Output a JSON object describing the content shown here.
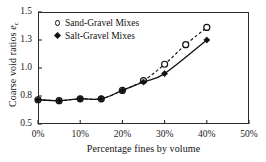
{
  "chart_data": {
    "type": "line",
    "title": "",
    "xlabel": "Percentage fines by volume",
    "ylabel": "Coarse void ratios",
    "ylabel_symbol": "e",
    "ylabel_subscript": "c",
    "x": [
      0,
      5,
      10,
      15,
      20,
      25,
      30,
      35,
      40
    ],
    "xtick_labels": [
      "0%",
      "10%",
      "20%",
      "30%",
      "40%",
      "50%"
    ],
    "xtick_values": [
      0,
      10,
      20,
      30,
      40,
      50
    ],
    "ytick_labels": [
      "0.5",
      "0.8",
      "1.0",
      "1.3",
      "1.5"
    ],
    "ytick_values": [
      0.5,
      0.8,
      1.0,
      1.3,
      1.5
    ],
    "xlim": [
      0,
      50
    ],
    "grid": false,
    "legend_position": "top-left",
    "series": [
      {
        "name": "Sand-Gravel Mixes",
        "marker": "open-circle",
        "line": "dashed",
        "color": "#111111",
        "x": [
          0,
          5,
          10,
          15,
          20,
          25,
          30,
          35,
          40
        ],
        "values": [
          0.76,
          0.75,
          0.77,
          0.77,
          0.84,
          0.91,
          1.04,
          1.25,
          1.39
        ]
      },
      {
        "name": "Salt-Gravel Mixes",
        "marker": "filled-diamond",
        "line": "solid",
        "color": "#111111",
        "x": [
          0,
          5,
          10,
          15,
          20,
          25,
          30,
          40
        ],
        "values": [
          0.76,
          0.75,
          0.77,
          0.77,
          0.84,
          0.9,
          0.96,
          1.3
        ]
      }
    ]
  },
  "legend": {
    "entries": [
      {
        "label": "Sand-Gravel Mixes",
        "marker": "open-circle"
      },
      {
        "label": "Salt-Gravel Mixes",
        "marker": "filled-diamond"
      }
    ]
  },
  "axes": {
    "x_title": "Percentage fines by volume",
    "y_title": "Coarse void ratios",
    "y_symbol": "e",
    "y_symbol_sub": "c"
  },
  "colors": {
    "axis": "#2b2b2b",
    "marker": "#111111",
    "background": "#ffffff"
  }
}
